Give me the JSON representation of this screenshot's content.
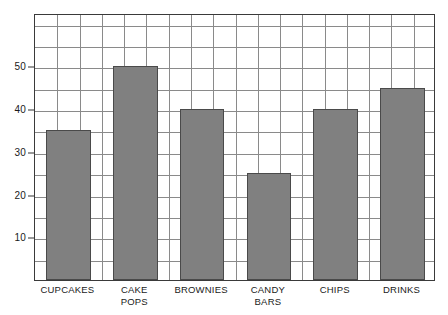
{
  "chart_data": {
    "type": "bar",
    "title": "",
    "subtitle": "",
    "xlabel": "",
    "ylabel": "",
    "categories": [
      "CUPCAKES",
      "CAKE POPS",
      "BROWNIES",
      "CANDY BARS",
      "CHIPS",
      "DRINKS"
    ],
    "values": [
      35,
      50,
      40,
      25,
      40,
      45
    ],
    "ylim": [
      0,
      62.5
    ],
    "y_tick_labels": [
      "10",
      "20",
      "30",
      "40",
      "50"
    ],
    "y_tick_values": [
      10,
      20,
      30,
      40,
      50
    ],
    "grid": {
      "horizontal_lines": true,
      "vertical_lines": true,
      "horizontal_step": 5,
      "vertical_columns": 18
    },
    "legend": {
      "visible": false,
      "position": "none",
      "entries": []
    },
    "annotations": [],
    "colors": {
      "bar_fill": "#808080",
      "bar_stroke": "#4a4a4a",
      "grid": "#8a8a8a",
      "frame": "#3a3a3a",
      "text": "#1a1a1a",
      "background": "#ffffff"
    }
  }
}
